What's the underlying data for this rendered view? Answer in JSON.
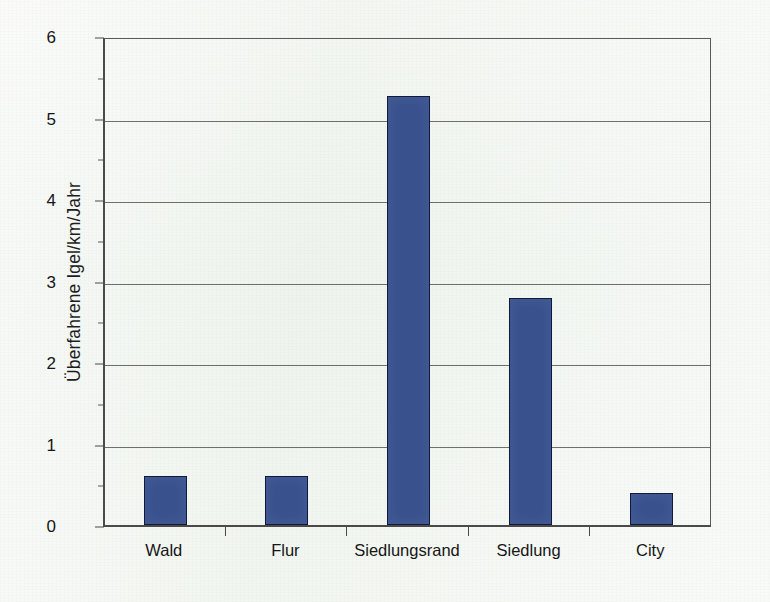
{
  "chart_data": {
    "type": "bar",
    "title": "",
    "subtitle": "",
    "xlabel": "",
    "ylabel": "Überfahrene Igel/km/Jahr",
    "categories": [
      "Wald",
      "Flur",
      "Siedlungsrand",
      "Siedlung",
      "City"
    ],
    "values": [
      0.6,
      0.6,
      5.3,
      2.8,
      0.4
    ],
    "series": [
      {
        "name": "Überfahrene Igel/km/Jahr",
        "values": [
          0.6,
          0.6,
          5.3,
          2.8,
          0.4
        ]
      }
    ],
    "ylim": [
      0,
      6
    ],
    "ytick_labels": [
      "0",
      "1",
      "2",
      "3",
      "4",
      "5",
      "6"
    ],
    "ytick_values": [
      0,
      1,
      2,
      3,
      4,
      5,
      6
    ],
    "grid": "horizontal",
    "legend": "none",
    "bar_color": "#39528e",
    "bar_border_color": "#12193a",
    "background_color": "#f2f6f1",
    "axis_color": "#4a4a48",
    "gridline_color": "#6d6f6b"
  }
}
